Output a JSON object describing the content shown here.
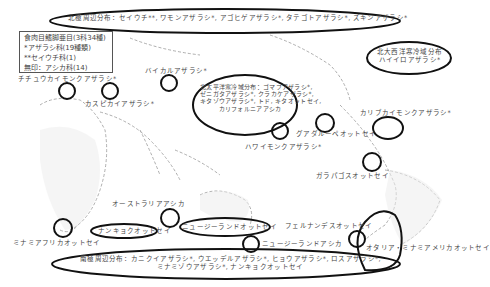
{
  "legend": {
    "title": "食肉目鰭脚亜目(3科34種)",
    "lines": [
      "*アザラシ科(19種類)",
      "**セイウチ科(1)",
      "無印：アシカ科(14)"
    ]
  },
  "regions": {
    "arctic": "北極周辺分布：セイウチ**, ワモンアザラシ*, アゴヒゲアザラシ*, タテゴトアザラシ*, ズキンアザラシ*",
    "north_pacific": [
      "北太平洋寒冷域分布：ゴマフアザラシ*,",
      "ゼニガタアザラシ*, クラカケアザラシ*,",
      "キタゾウアザラシ*, トド, キタオットセイ,",
      "カリフォルニアアシカ"
    ],
    "north_atlantic": [
      "北大西洋寒冷域分布",
      "ハイイロアザラシ*"
    ],
    "antarctic": [
      "南極周辺分布：カニクイアザラシ*, ウエッデルアザラシ*, ヒョウアザラシ*, ロスアザラシ*,",
      "ミナミゾウアザラシ*, ナンキョクオットセイ"
    ]
  },
  "species_labels": {
    "mediterranean_monk": "チチュウカイモンクアザラシ*",
    "baikal": "バイカルアザラシ*",
    "caspian": "カスピカイアザラシ*",
    "caribbean_monk": "カリブカイモンクアザラシ*",
    "guadalupe": "グアダルーペオットセイ",
    "hawaiian_monk": "ハワイモンクアザラシ*",
    "galapagos": "ガラパゴスオットセイ",
    "australian": "オーストラリアアシカ",
    "south_african": "ミナミアフリカオットセイ",
    "antarctic_fur": "ナンキョクオットセイ",
    "nz_fur": "ニュージーランドオットセイ",
    "nz_sealion": "ニュージーランドアシカ",
    "juan_fernandez": "フェルナンデスオットセイ",
    "south_american": "オタリア・ミナミアメリカオットセイ"
  }
}
